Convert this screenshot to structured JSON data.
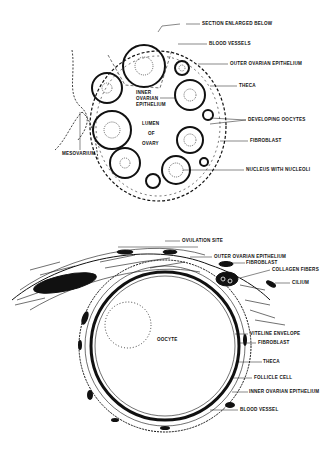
{
  "figure": {
    "top_diagram": {
      "labels": {
        "section": "SECTION ENLARGED BELOW",
        "blood_vessels": "BLOOD VESSELS",
        "outer_epithelium": "OUTER OVARIAN EPITHELIUM",
        "theca": "THECA",
        "inner_epithelium_1": "INNER",
        "inner_epithelium_2": "OVARIAN",
        "inner_epithelium_3": "EPITHELIUM",
        "lumen_1": "LUMEN",
        "lumen_2": "OF",
        "lumen_3": "OVARY",
        "developing_oocytes": "DEVELOPING OOCYTES",
        "fibroblast": "FIBROBLAST",
        "nucleus": "NUCLEUS WITH NUCLEOLI",
        "mesovarium": "MESOVARIUM"
      }
    },
    "bottom_diagram": {
      "labels": {
        "ovulation_site": "OVULATION SITE",
        "outer_epithelium": "OUTER OVARIAN EPITHELIUM",
        "fibroblast_top": "FIBROBLAST",
        "collagen_fibers": "COLLAGEN FIBERS",
        "cilium": "CILIUM",
        "oocyte": "OOCYTE",
        "vitelline_envelope": "VITELINE ENVELOPE",
        "fibroblast_mid": "FIBROBLAST",
        "theca": "THECA",
        "follicle_cell": "FOLLICLE CELL",
        "inner_epithelium": "INNER OVARIAN EPITHELIUM",
        "blood_vessel": "BLOOD VESSEL"
      }
    }
  }
}
